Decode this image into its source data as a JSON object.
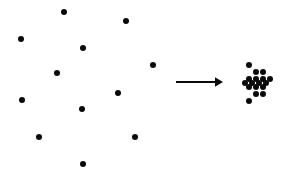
{
  "figure": {
    "width": 289,
    "height": 177,
    "background_color": "#ffffff",
    "dot_color": "#0a0a0a",
    "arrow_color": "#0a0a0a",
    "caption": ""
  },
  "chart_data": {
    "type": "scatter",
    "title": "",
    "subtitle": "",
    "xlabel": "",
    "ylabel": "",
    "xlim": [
      0,
      289
    ],
    "ylim": [
      0,
      177
    ],
    "grid": false,
    "legend": null,
    "annotations": [
      {
        "name": "transformation-arrow",
        "shape": "arrow",
        "direction": "right",
        "x_start": 176,
        "x_end": 223,
        "y": 82,
        "line_width": 1.8,
        "color": "#0a0a0a",
        "label": ""
      }
    ],
    "series": [
      {
        "name": "scattered-points",
        "marker": "circle",
        "marker_size": 6.5,
        "color": "#0a0a0a",
        "count": 12,
        "points": [
          {
            "x": 64,
            "y": 12
          },
          {
            "x": 126,
            "y": 21
          },
          {
            "x": 21,
            "y": 39
          },
          {
            "x": 83,
            "y": 48
          },
          {
            "x": 153,
            "y": 65
          },
          {
            "x": 57,
            "y": 73
          },
          {
            "x": 118,
            "y": 93
          },
          {
            "x": 22,
            "y": 100
          },
          {
            "x": 82,
            "y": 109
          },
          {
            "x": 39,
            "y": 137
          },
          {
            "x": 135,
            "y": 137
          },
          {
            "x": 83,
            "y": 164
          }
        ]
      },
      {
        "name": "clustered-points",
        "marker": "circle",
        "marker_size": 6.5,
        "color": "#0a0a0a",
        "count": 17,
        "points": [
          {
            "x": 249,
            "y": 65
          },
          {
            "x": 256,
            "y": 72
          },
          {
            "x": 263,
            "y": 72
          },
          {
            "x": 249,
            "y": 79
          },
          {
            "x": 256,
            "y": 79
          },
          {
            "x": 263,
            "y": 79
          },
          {
            "x": 270,
            "y": 79
          },
          {
            "x": 245,
            "y": 83
          },
          {
            "x": 252,
            "y": 83
          },
          {
            "x": 259,
            "y": 83
          },
          {
            "x": 266,
            "y": 83
          },
          {
            "x": 249,
            "y": 87
          },
          {
            "x": 256,
            "y": 87
          },
          {
            "x": 263,
            "y": 87
          },
          {
            "x": 256,
            "y": 94
          },
          {
            "x": 263,
            "y": 94
          },
          {
            "x": 249,
            "y": 101
          }
        ]
      }
    ]
  }
}
